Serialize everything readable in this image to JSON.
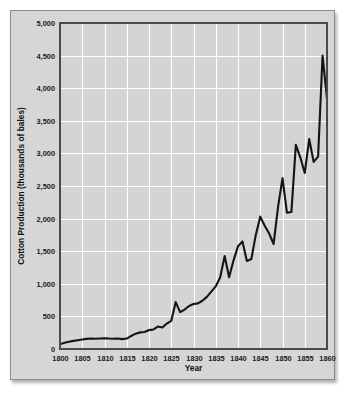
{
  "chart_data": {
    "type": "line",
    "title": "",
    "xlabel": "Year",
    "ylabel": "Cotton Production (thousands of bales)",
    "xlim": [
      1800,
      1860
    ],
    "ylim": [
      0,
      5000
    ],
    "grid": true,
    "legend": null,
    "x_ticks": [
      "1800",
      "1805",
      "1810",
      "1815",
      "1820",
      "1825",
      "1830",
      "1835",
      "1840",
      "1845",
      "1850",
      "1855",
      "1860"
    ],
    "y_ticks": [
      "0",
      "500",
      "1,000",
      "1,500",
      "2,000",
      "2,500",
      "3,000",
      "3,500",
      "4,000",
      "4,500",
      "5,000"
    ],
    "x_tick_values": [
      1800,
      1805,
      1810,
      1815,
      1820,
      1825,
      1830,
      1835,
      1840,
      1845,
      1850,
      1855,
      1860
    ],
    "y_tick_values": [
      0,
      500,
      1000,
      1500,
      2000,
      2500,
      3000,
      3500,
      4000,
      4500,
      5000
    ],
    "series": [
      {
        "name": "Cotton Production",
        "color": "#141414",
        "x": [
          1800,
          1801,
          1802,
          1803,
          1804,
          1805,
          1806,
          1807,
          1808,
          1809,
          1810,
          1811,
          1812,
          1813,
          1814,
          1815,
          1816,
          1817,
          1818,
          1819,
          1820,
          1821,
          1822,
          1823,
          1824,
          1825,
          1826,
          1827,
          1828,
          1829,
          1830,
          1831,
          1832,
          1833,
          1834,
          1835,
          1836,
          1837,
          1838,
          1839,
          1840,
          1841,
          1842,
          1843,
          1844,
          1845,
          1846,
          1847,
          1848,
          1849,
          1850,
          1851,
          1852,
          1853,
          1854,
          1855,
          1856,
          1857,
          1858,
          1859,
          1860
        ],
        "y": [
          73,
          95,
          110,
          125,
          135,
          146,
          155,
          162,
          158,
          161,
          165,
          160,
          158,
          160,
          152,
          160,
          200,
          235,
          255,
          262,
          290,
          300,
          345,
          330,
          390,
          430,
          720,
          565,
          605,
          660,
          690,
          700,
          740,
          800,
          880,
          960,
          1100,
          1425,
          1100,
          1360,
          1575,
          1650,
          1350,
          1380,
          1750,
          2030,
          1890,
          1770,
          1610,
          2180,
          2620,
          2090,
          2100,
          3130,
          2940,
          2700,
          3220,
          2870,
          2950,
          4500,
          3840
        ]
      }
    ]
  },
  "figure": {
    "background_color": "#ffffff",
    "card_color": "#d6d6d6",
    "plot_background_color": "#d4d4d4",
    "gridline_color": "#ffffff",
    "frame_color": "#4a4a4a",
    "line_color": "#141414"
  }
}
